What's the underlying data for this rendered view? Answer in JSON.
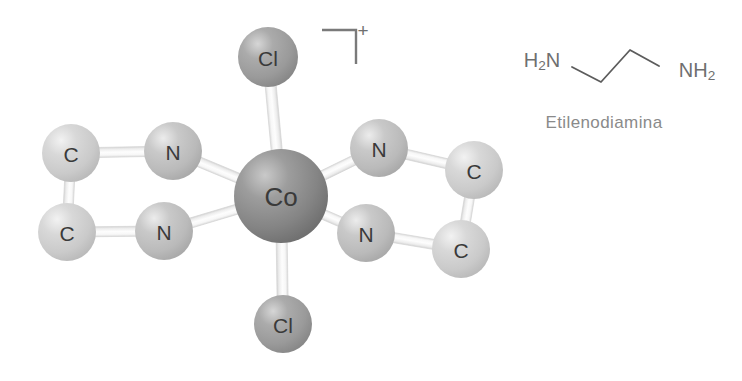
{
  "figure": {
    "background_color": "#ffffff",
    "title_visible": false
  },
  "complex": {
    "name": "trans-dichlorobis(ethylenediamine)cobalt(III) cation",
    "charge_label": "+",
    "bracket": {
      "name": "charge-bracket",
      "shape": "top-right-corner",
      "x": 322,
      "y": 30,
      "width": 34,
      "height": 34,
      "stroke": "#7a7a7a",
      "stroke_width": 2.4
    },
    "charge_superscript": {
      "text": "+",
      "x": 363,
      "y": 30,
      "font_size": 19
    },
    "atoms": [
      {
        "id": "cl-top",
        "element": "Cl",
        "label": "Cl",
        "cx": 268,
        "cy": 57,
        "r": 30,
        "fill": "#9e9e9e",
        "font_size": 21
      },
      {
        "id": "cl-bottom",
        "element": "Cl",
        "label": "Cl",
        "cx": 283,
        "cy": 324,
        "r": 29,
        "fill": "#a2a2a2",
        "font_size": 21
      },
      {
        "id": "co-center",
        "element": "Co",
        "label": "Co",
        "cx": 281,
        "cy": 196,
        "r": 47,
        "fill": "#8a8a8a",
        "font_size": 26
      },
      {
        "id": "n-left-top",
        "element": "N",
        "label": "N",
        "cx": 173,
        "cy": 151,
        "r": 29,
        "fill": "#bdbdbd",
        "font_size": 21
      },
      {
        "id": "n-left-bottom",
        "element": "N",
        "label": "N",
        "cx": 164,
        "cy": 231,
        "r": 29,
        "fill": "#bdbdbd",
        "font_size": 21
      },
      {
        "id": "c-left-top",
        "element": "C",
        "label": "C",
        "cx": 71,
        "cy": 153,
        "r": 29,
        "fill": "#cdcdcd",
        "font_size": 21
      },
      {
        "id": "c-left-bottom",
        "element": "C",
        "label": "C",
        "cx": 67,
        "cy": 232,
        "r": 29,
        "fill": "#cdcdcd",
        "font_size": 21
      },
      {
        "id": "n-right-top",
        "element": "N",
        "label": "N",
        "cx": 379,
        "cy": 148,
        "r": 29,
        "fill": "#bdbdbd",
        "font_size": 21
      },
      {
        "id": "n-right-bottom",
        "element": "N",
        "label": "N",
        "cx": 366,
        "cy": 233,
        "r": 29,
        "fill": "#bdbdbd",
        "font_size": 21
      },
      {
        "id": "c-right-top",
        "element": "C",
        "label": "C",
        "cx": 474,
        "cy": 170,
        "r": 29,
        "fill": "#cdcdcd",
        "font_size": 21
      },
      {
        "id": "c-right-bottom",
        "element": "C",
        "label": "C",
        "cx": 461,
        "cy": 249,
        "r": 29,
        "fill": "#cdcdcd",
        "font_size": 21
      }
    ],
    "bonds": [
      {
        "id": "bond-co-cl-top",
        "from": "co-center",
        "to": "cl-top",
        "width": 11
      },
      {
        "id": "bond-co-cl-bottom",
        "from": "co-center",
        "to": "cl-bottom",
        "width": 11
      },
      {
        "id": "bond-co-n-lt",
        "from": "co-center",
        "to": "n-left-top",
        "width": 10
      },
      {
        "id": "bond-co-n-lb",
        "from": "co-center",
        "to": "n-left-bottom",
        "width": 10
      },
      {
        "id": "bond-co-n-rt",
        "from": "co-center",
        "to": "n-right-top",
        "width": 10
      },
      {
        "id": "bond-co-n-rb",
        "from": "co-center",
        "to": "n-right-bottom",
        "width": 10
      },
      {
        "id": "bond-n-c-lt",
        "from": "n-left-top",
        "to": "c-left-top",
        "width": 10
      },
      {
        "id": "bond-n-c-lb",
        "from": "n-left-bottom",
        "to": "c-left-bottom",
        "width": 10
      },
      {
        "id": "bond-c-c-left",
        "from": "c-left-top",
        "to": "c-left-bottom",
        "width": 10
      },
      {
        "id": "bond-n-c-rt",
        "from": "n-right-top",
        "to": "c-right-top",
        "width": 10
      },
      {
        "id": "bond-n-c-rb",
        "from": "n-right-bottom",
        "to": "c-right-bottom",
        "width": 10
      },
      {
        "id": "bond-c-c-right",
        "from": "c-right-top",
        "to": "c-right-bottom",
        "width": 10
      }
    ]
  },
  "ligand_diagram": {
    "name": "ethylenediamine-skeletal-formula",
    "left_label": "H₂N",
    "right_label": "NH₂",
    "caption": "Etilenodiamina",
    "left_label_pos": {
      "x": 542,
      "y": 60,
      "font_size": 20
    },
    "right_label_pos": {
      "x": 697,
      "y": 70,
      "font_size": 20
    },
    "caption_pos": {
      "x": 604,
      "y": 122,
      "font_size": 17
    },
    "stroke": "#5c5c5c",
    "stroke_width": 1.8,
    "chain_points": "572,67 601,82 630,50 659,66",
    "bond_color": "#5c5c5c"
  },
  "palette": {
    "cobalt": "#8a8a8a",
    "chlorine": "#9e9e9e",
    "nitrogen": "#bdbdbd",
    "carbon": "#cdcdcd",
    "bond": "#e8e8e8",
    "bond_edge": "#d4d4d4",
    "text_dark": "#3a3a3a",
    "text_gray": "#6f6f6f",
    "caption_gray": "#8a8a8a",
    "background": "#ffffff"
  }
}
